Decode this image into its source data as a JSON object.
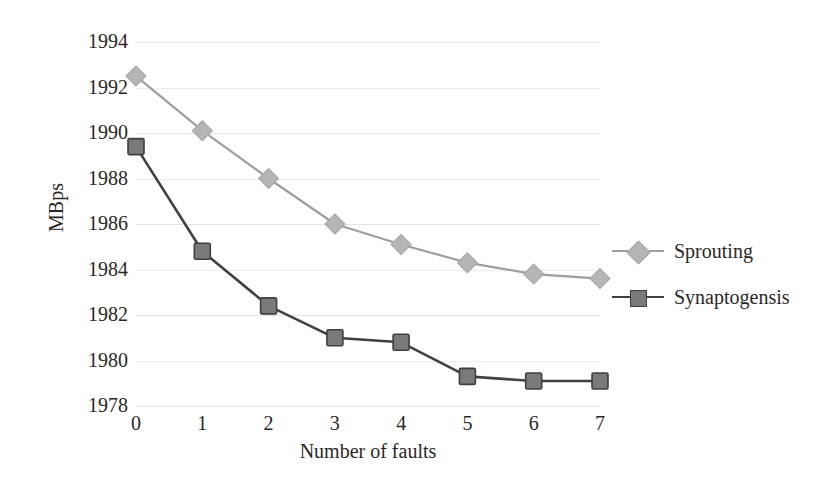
{
  "chart_data": {
    "type": "line",
    "title": "",
    "xlabel": "Number of faults",
    "ylabel": "MBps",
    "x": [
      0,
      1,
      2,
      3,
      4,
      5,
      6,
      7
    ],
    "xticklabels": [
      "0",
      "1",
      "2",
      "3",
      "4",
      "5",
      "6",
      "7"
    ],
    "yticklabels": [
      "1994",
      "1992",
      "1990",
      "1988",
      "1986",
      "1984",
      "1982",
      "1980",
      "1978"
    ],
    "yticks": [
      1994,
      1992,
      1990,
      1988,
      1986,
      1984,
      1982,
      1980,
      1978
    ],
    "ylim": [
      1978,
      1994
    ],
    "xlim": [
      0,
      7
    ],
    "grid": true,
    "grid_axis": "y",
    "legend_position": "right",
    "series": [
      {
        "name": "Sprouting",
        "marker": "diamond",
        "color": "#b5b5b5",
        "line_color": "#9e9e9e",
        "values": [
          1992.5,
          1990.1,
          1988.0,
          1986.0,
          1985.1,
          1984.3,
          1983.8,
          1983.6
        ]
      },
      {
        "name": "Synaptogensis",
        "marker": "square",
        "color": "#7a7a7a",
        "line_color": "#404040",
        "values": [
          1989.4,
          1984.8,
          1982.4,
          1981.0,
          1980.8,
          1979.3,
          1979.1,
          1979.1
        ]
      }
    ]
  },
  "legend": {
    "items": [
      {
        "label": "Sprouting",
        "marker": "diamond-marker",
        "color": "#b5b5b5",
        "line_color": "#9e9e9e"
      },
      {
        "label": "Synaptogensis",
        "marker": "square-marker",
        "color": "#7a7a7a",
        "line_color": "#404040"
      }
    ]
  },
  "colors": {
    "background": "#ffffff",
    "text": "#2b2726",
    "gridline": "#e6e4e2",
    "sprouting": "#b5b5b5",
    "synaptogensis": "#6f6f6f"
  }
}
